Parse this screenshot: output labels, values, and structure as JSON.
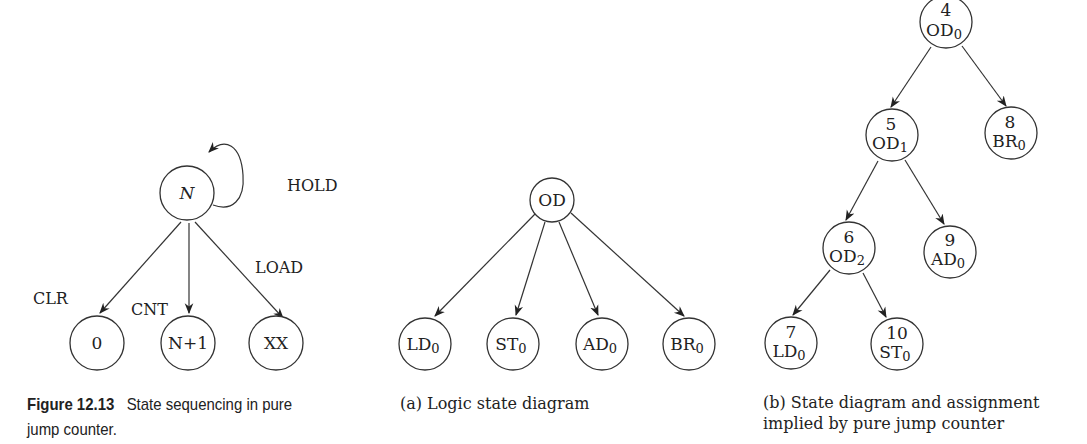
{
  "figure_left": {
    "nodes": {
      "n": "N",
      "zero": "0",
      "n_plus_1": "N+1",
      "xx": "XX"
    },
    "edge_labels": {
      "hold": "HOLD",
      "clr": "CLR",
      "cnt": "CNT",
      "load": "LOAD"
    },
    "caption": {
      "number": "Figure 12.13",
      "text_line1": "State sequencing in pure",
      "text_line2": "jump counter."
    }
  },
  "figure_a": {
    "root": "OD",
    "children": [
      {
        "base": "LD",
        "sub": "0"
      },
      {
        "base": "ST",
        "sub": "0"
      },
      {
        "base": "AD",
        "sub": "0"
      },
      {
        "base": "BR",
        "sub": "0"
      }
    ],
    "caption": "(a) Logic state diagram"
  },
  "figure_b": {
    "nodes": {
      "s4": {
        "num": "4",
        "base": "OD",
        "sub": "0"
      },
      "s5": {
        "num": "5",
        "base": "OD",
        "sub": "1"
      },
      "s8": {
        "num": "8",
        "base": "BR",
        "sub": "0"
      },
      "s6": {
        "num": "6",
        "base": "OD",
        "sub": "2"
      },
      "s9": {
        "num": "9",
        "base": "AD",
        "sub": "0"
      },
      "s7": {
        "num": "7",
        "base": "LD",
        "sub": "0"
      },
      "s10": {
        "num": "10",
        "base": "ST",
        "sub": "0"
      }
    },
    "caption_line1": "(b) State diagram and assignment",
    "caption_line2": "implied by pure jump counter"
  }
}
